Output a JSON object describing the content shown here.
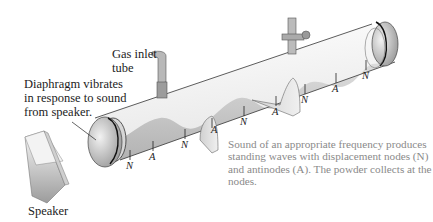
{
  "labels": {
    "gas_inlet_line1": "Gas inlet",
    "gas_inlet_line2": "tube",
    "diaphragm_line1": "Diaphragm vibrates",
    "diaphragm_line2": "in response to sound",
    "diaphragm_line3": "from speaker.",
    "speaker": "Speaker"
  },
  "caption": {
    "line1": "Sound of an appropriate frequency produces",
    "line2": "standing waves with displacement nodes (N)",
    "line3": "and antinodes (A). The powder collects at the",
    "line4": "nodes."
  },
  "markers": [
    {
      "text": "N"
    },
    {
      "text": "A"
    },
    {
      "text": "N"
    },
    {
      "text": "A"
    },
    {
      "text": "N"
    },
    {
      "text": "A"
    },
    {
      "text": "N"
    },
    {
      "text": "A"
    },
    {
      "text": "N"
    }
  ],
  "colors": {
    "tube_fill": "#eeeeee",
    "powder": "#bdbdbd",
    "caption_text": "#8a8a8a"
  }
}
